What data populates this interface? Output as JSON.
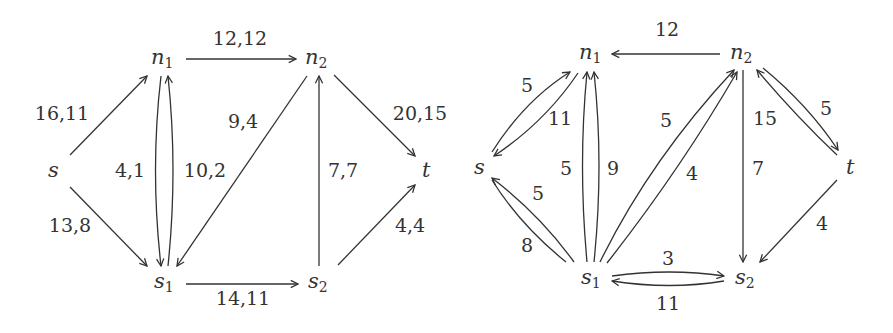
{
  "graphs": [
    {
      "name": "flow-network",
      "nodes": [
        {
          "id": "s",
          "label": "s",
          "sub": "",
          "x": 55,
          "y": 170
        },
        {
          "id": "n1",
          "label": "n",
          "sub": "1",
          "x": 162,
          "y": 58
        },
        {
          "id": "n2",
          "label": "n",
          "sub": "2",
          "x": 318,
          "y": 58
        },
        {
          "id": "s1",
          "label": "s",
          "sub": "1",
          "x": 163,
          "y": 282
        },
        {
          "id": "s2",
          "label": "s",
          "sub": "2",
          "x": 318,
          "y": 282
        },
        {
          "id": "t",
          "label": "t",
          "sub": "",
          "x": 428,
          "y": 170
        }
      ],
      "edges": [
        {
          "from": "s",
          "to": "n1",
          "label": "16,11",
          "lx": 62,
          "ly": 120
        },
        {
          "from": "s",
          "to": "s1",
          "label": "13,8",
          "lx": 70,
          "ly": 232
        },
        {
          "from": "n1",
          "to": "n2",
          "label": "12,12",
          "lx": 240,
          "ly": 45
        },
        {
          "from": "n1",
          "to": "s1",
          "label": "4,1",
          "lx": 130,
          "ly": 177
        },
        {
          "from": "s1",
          "to": "n1",
          "label": "10,2",
          "lx": 205,
          "ly": 177
        },
        {
          "from": "n2",
          "to": "s1",
          "label": "9,4",
          "lx": 243,
          "ly": 128
        },
        {
          "from": "s2",
          "to": "n2",
          "label": "7,7",
          "lx": 343,
          "ly": 177
        },
        {
          "from": "n2",
          "to": "t",
          "label": "20,15",
          "lx": 420,
          "ly": 120
        },
        {
          "from": "s2",
          "to": "t",
          "label": "4,4",
          "lx": 410,
          "ly": 232
        },
        {
          "from": "s1",
          "to": "s2",
          "label": "14,11",
          "lx": 243,
          "ly": 305
        }
      ]
    },
    {
      "name": "residual-network",
      "nodes": [
        {
          "id": "s",
          "label": "s",
          "sub": "",
          "x": 480,
          "y": 167
        },
        {
          "id": "n1",
          "label": "n",
          "sub": "1",
          "x": 590,
          "y": 53
        },
        {
          "id": "n2",
          "label": "n",
          "sub": "2",
          "x": 742,
          "y": 53
        },
        {
          "id": "s1",
          "label": "s",
          "sub": "1",
          "x": 590,
          "y": 278
        },
        {
          "id": "s2",
          "label": "s",
          "sub": "2",
          "x": 745,
          "y": 278
        },
        {
          "id": "t",
          "label": "t",
          "sub": "",
          "x": 850,
          "y": 167
        }
      ],
      "edges": [
        {
          "from": "n2",
          "to": "n1",
          "label": "12",
          "lx": 667,
          "ly": 36
        },
        {
          "from": "s",
          "to": "n1",
          "label": "5",
          "lx": 527,
          "ly": 92
        },
        {
          "from": "n1",
          "to": "s",
          "label": "11",
          "lx": 560,
          "ly": 125
        },
        {
          "from": "s1",
          "to": "s",
          "label": "5",
          "lx": 538,
          "ly": 200
        },
        {
          "from": "s1",
          "to": "s",
          "label": "8",
          "lx": 527,
          "ly": 252
        },
        {
          "from": "s1",
          "to": "n1",
          "label": "5",
          "lx": 566,
          "ly": 175
        },
        {
          "from": "s1",
          "to": "n1",
          "label": "9",
          "lx": 613,
          "ly": 175
        },
        {
          "from": "s1",
          "to": "n2",
          "label": "5",
          "lx": 666,
          "ly": 127
        },
        {
          "from": "s1",
          "to": "n2",
          "label": "4",
          "lx": 692,
          "ly": 180
        },
        {
          "from": "n2",
          "to": "s2",
          "label": "7",
          "lx": 758,
          "ly": 175
        },
        {
          "from": "t",
          "to": "n2",
          "label": "15",
          "lx": 765,
          "ly": 125
        },
        {
          "from": "n2",
          "to": "t",
          "label": "5",
          "lx": 826,
          "ly": 115
        },
        {
          "from": "t",
          "to": "s2",
          "label": "4",
          "lx": 822,
          "ly": 230
        },
        {
          "from": "s1",
          "to": "s2",
          "label": "3",
          "lx": 668,
          "ly": 265
        },
        {
          "from": "s2",
          "to": "s1",
          "label": "11",
          "lx": 668,
          "ly": 310
        }
      ]
    }
  ]
}
